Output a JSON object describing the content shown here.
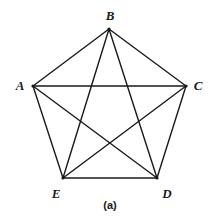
{
  "figure": {
    "caption": "(a)",
    "caption_pos": {
      "x": 110,
      "y": 205
    },
    "background_color": "#ffffff",
    "stroke_color": "#1a1a1a",
    "stroke_width": 1.4,
    "vertex_dot_radius": 1.6
  },
  "chart_data": {
    "type": "diagram",
    "diagram_type": "graph",
    "title": "(a)",
    "nodes": [
      {
        "id": "A",
        "label": "A",
        "x": 33,
        "y": 86,
        "label_x": 20,
        "label_y": 85
      },
      {
        "id": "B",
        "label": "B",
        "x": 109,
        "y": 29,
        "label_x": 110,
        "label_y": 15
      },
      {
        "id": "C",
        "label": "C",
        "x": 186,
        "y": 86,
        "label_x": 198,
        "label_y": 85
      },
      {
        "id": "D",
        "label": "D",
        "x": 157,
        "y": 178,
        "label_x": 167,
        "label_y": 193
      },
      {
        "id": "E",
        "label": "E",
        "x": 63,
        "y": 178,
        "label_x": 56,
        "label_y": 193
      }
    ],
    "edges": [
      {
        "from": "A",
        "to": "B",
        "kind": "side"
      },
      {
        "from": "B",
        "to": "C",
        "kind": "side"
      },
      {
        "from": "C",
        "to": "D",
        "kind": "side"
      },
      {
        "from": "D",
        "to": "E",
        "kind": "side"
      },
      {
        "from": "E",
        "to": "A",
        "kind": "side"
      },
      {
        "from": "A",
        "to": "C",
        "kind": "diagonal"
      },
      {
        "from": "A",
        "to": "D",
        "kind": "diagonal"
      },
      {
        "from": "B",
        "to": "D",
        "kind": "diagonal"
      },
      {
        "from": "B",
        "to": "E",
        "kind": "diagonal"
      },
      {
        "from": "C",
        "to": "E",
        "kind": "diagonal"
      }
    ],
    "node_count": 5,
    "edge_count": 10,
    "xlabel": "",
    "ylabel": "",
    "legend": []
  }
}
